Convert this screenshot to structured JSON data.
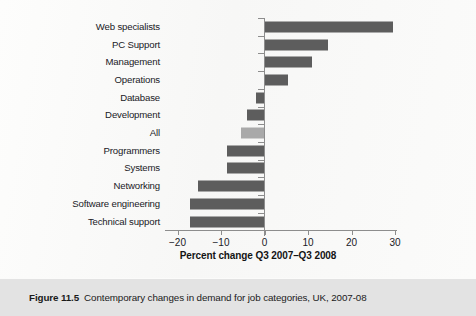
{
  "figure": {
    "caption_label": "Figure 11.5",
    "caption_text": "Contemporary changes in demand for job categories, UK, 2007-08"
  },
  "chart_data": {
    "type": "bar",
    "orientation": "horizontal",
    "title": "",
    "xlabel": "Percent change Q3 2007–Q3 2008",
    "ylabel": "",
    "xlim": [
      -20,
      30
    ],
    "xticks": [
      -20,
      -10,
      0,
      10,
      20,
      30
    ],
    "xtick_labels": [
      "−20",
      "−10",
      "0",
      "10",
      "20",
      "30"
    ],
    "grid": false,
    "legend": "none",
    "bar_color": "#5d5d5d",
    "highlight_color": "#a9a9a9",
    "categories": [
      "Web specialists",
      "PC Support",
      "Management",
      "Operations",
      "Database",
      "Development",
      "All",
      "Programmers",
      "Systems",
      "Networking",
      "Software engineering",
      "Technical support"
    ],
    "values": [
      29.5,
      14.5,
      11.0,
      5.5,
      -2.0,
      -4.0,
      -5.5,
      -8.7,
      -8.7,
      -15.4,
      -17.2,
      -17.2
    ],
    "highlighted_category": "All"
  }
}
